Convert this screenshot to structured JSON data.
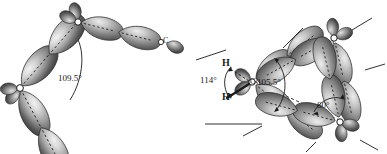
{
  "figure": {
    "background_color": "#ffffff",
    "ink_color": "#1a1a1a",
    "lobe_dark": "#4a4a4a",
    "lobe_light": "#e8e8e8",
    "panels": [
      {
        "id": "left-panel",
        "name": "normal-tetrahedral-chain",
        "description": "Chain of carbon atoms with sp3 hybrid orbitals overlapping head-on, normal bond angle",
        "atoms": [
          {
            "id": "c-lower-left",
            "label": "",
            "x": 20,
            "y": 88
          },
          {
            "id": "c-upper-middle",
            "label": "",
            "x": 78,
            "y": 22
          },
          {
            "id": "c-right-end",
            "label": "C",
            "x": 163,
            "y": 42
          }
        ],
        "angles": [
          {
            "id": "tetrahedral-angle",
            "value": "109.5°",
            "x": 58,
            "y": 74
          }
        ]
      },
      {
        "id": "right-panel",
        "name": "cyclopropane-bent-bonds",
        "description": "Three-membered carbon ring showing bent (banana) bonds, strained geometry",
        "atoms": [
          {
            "id": "c-left",
            "label": "C",
            "x": 252,
            "y": 82
          },
          {
            "id": "c-top-right",
            "label": "C",
            "x": 334,
            "y": 38
          },
          {
            "id": "c-bottom-right",
            "label": "C",
            "x": 340,
            "y": 122
          }
        ],
        "hydrogens": [
          {
            "id": "h-upper",
            "label": "H",
            "x": 222,
            "y": 64
          },
          {
            "id": "h-lower",
            "label": "H",
            "x": 222,
            "y": 97
          }
        ],
        "angles": [
          {
            "id": "hch-angle",
            "value": "114°",
            "x": 203,
            "y": 79
          },
          {
            "id": "orbital-angle",
            "value": "105.5°",
            "x": 259,
            "y": 80
          },
          {
            "id": "internuclear-angle",
            "value": "60°",
            "x": 319,
            "y": 104
          }
        ]
      }
    ]
  }
}
